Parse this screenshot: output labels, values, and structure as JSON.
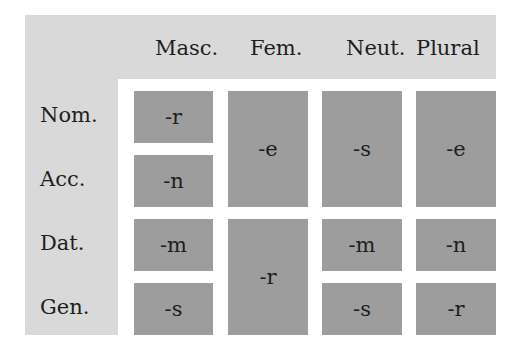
{
  "columns": [
    "Masc.",
    "Fem.",
    "Neut.",
    "Plural"
  ],
  "rows": [
    "Nom.",
    "Acc.",
    "Dat.",
    "Gen."
  ],
  "cells": {
    "masc_nom": "-r",
    "masc_acc": "-n",
    "masc_dat": "-m",
    "masc_gen": "-s",
    "fem_nom_acc": "-e",
    "fem_dat_gen": "-r",
    "neut_nom_acc": "-s",
    "neut_dat": "-m",
    "neut_gen": "-s",
    "plural_nom_acc": "-e",
    "plural_dat": "-n",
    "plural_gen": "-r"
  },
  "colors": {
    "header_panel": "#d9d9d9",
    "cell_fill": "#9d9d9d",
    "background": "#ffffff"
  }
}
